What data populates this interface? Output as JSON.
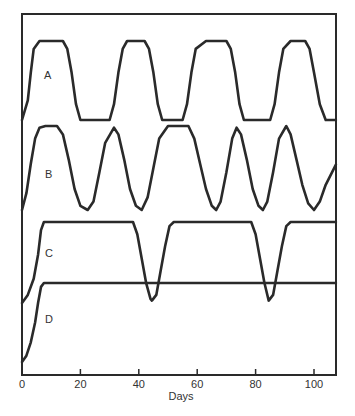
{
  "chart_data": {
    "type": "line",
    "title": "",
    "xlabel": "Days",
    "ylabel": "",
    "xlim": [
      0,
      107.5
    ],
    "xticks": [
      0,
      20,
      40,
      60,
      80,
      100
    ],
    "xtick_labels": [
      "0",
      "20",
      "40",
      "60",
      "80",
      "100"
    ],
    "grid": false,
    "legend": "none (curves labelled inline A, B, C, D)",
    "y_units": "relative level within each stacked band (0 = low, 1 = high)",
    "series": [
      {
        "name": "A",
        "label": "A",
        "band_px": [
          41,
          120
        ],
        "points": [
          [
            0,
            0
          ],
          [
            2,
            0.25
          ],
          [
            3,
            0.6
          ],
          [
            4,
            0.9
          ],
          [
            6,
            1
          ],
          [
            14,
            1
          ],
          [
            15.5,
            0.9
          ],
          [
            17,
            0.6
          ],
          [
            18.5,
            0.2
          ],
          [
            20,
            0
          ],
          [
            30,
            0
          ],
          [
            31.5,
            0.2
          ],
          [
            33,
            0.6
          ],
          [
            34.5,
            0.9
          ],
          [
            36,
            1
          ],
          [
            42,
            1
          ],
          [
            43.5,
            0.9
          ],
          [
            45,
            0.6
          ],
          [
            46.5,
            0.2
          ],
          [
            48,
            0
          ],
          [
            55,
            0
          ],
          [
            56.5,
            0.2
          ],
          [
            58,
            0.6
          ],
          [
            59.5,
            0.9
          ],
          [
            63,
            1
          ],
          [
            70,
            1
          ],
          [
            71.5,
            0.9
          ],
          [
            73,
            0.6
          ],
          [
            74.5,
            0.2
          ],
          [
            76,
            0
          ],
          [
            85,
            0
          ],
          [
            86.5,
            0.2
          ],
          [
            88,
            0.6
          ],
          [
            89.5,
            0.9
          ],
          [
            92,
            1
          ],
          [
            97,
            1
          ],
          [
            98.5,
            0.9
          ],
          [
            100,
            0.6
          ],
          [
            102,
            0.2
          ],
          [
            104,
            0
          ],
          [
            107.5,
            0
          ]
        ]
      },
      {
        "name": "B",
        "label": "B",
        "band_px": [
          126,
          210
        ],
        "points": [
          [
            0,
            0
          ],
          [
            1.5,
            0.2
          ],
          [
            3,
            0.55
          ],
          [
            4.5,
            0.85
          ],
          [
            6,
            0.98
          ],
          [
            8,
            1
          ],
          [
            12,
            1
          ],
          [
            14,
            0.9
          ],
          [
            16,
            0.6
          ],
          [
            18,
            0.25
          ],
          [
            20,
            0.05
          ],
          [
            22.5,
            0
          ],
          [
            24.5,
            0.1
          ],
          [
            26.5,
            0.45
          ],
          [
            28.5,
            0.8
          ],
          [
            31.5,
            0.98
          ],
          [
            33,
            0.9
          ],
          [
            35,
            0.6
          ],
          [
            37,
            0.25
          ],
          [
            39,
            0.05
          ],
          [
            41,
            0
          ],
          [
            43,
            0.15
          ],
          [
            45,
            0.5
          ],
          [
            47,
            0.85
          ],
          [
            50,
            1
          ],
          [
            57,
            1
          ],
          [
            59,
            0.85
          ],
          [
            61,
            0.55
          ],
          [
            63,
            0.25
          ],
          [
            65,
            0.05
          ],
          [
            66.5,
            0
          ],
          [
            68,
            0.1
          ],
          [
            70,
            0.45
          ],
          [
            72,
            0.85
          ],
          [
            73.5,
            0.98
          ],
          [
            75,
            0.9
          ],
          [
            77,
            0.6
          ],
          [
            79,
            0.25
          ],
          [
            81,
            0.05
          ],
          [
            82.5,
            0
          ],
          [
            84,
            0.1
          ],
          [
            86,
            0.45
          ],
          [
            88,
            0.85
          ],
          [
            90.5,
            1
          ],
          [
            92,
            0.9
          ],
          [
            94,
            0.6
          ],
          [
            96,
            0.3
          ],
          [
            98,
            0.08
          ],
          [
            100,
            0
          ],
          [
            102,
            0.1
          ],
          [
            104,
            0.3
          ],
          [
            107.5,
            0.54
          ]
        ]
      },
      {
        "name": "C",
        "label": "C",
        "band_px": [
          222,
          303
        ],
        "points": [
          [
            0,
            0
          ],
          [
            2,
            0.1
          ],
          [
            4,
            0.3
          ],
          [
            5.5,
            0.6
          ],
          [
            6.5,
            0.9
          ],
          [
            7.5,
            1
          ],
          [
            38,
            1
          ],
          [
            39.5,
            0.85
          ],
          [
            41,
            0.55
          ],
          [
            42.5,
            0.25
          ],
          [
            44,
            0.05
          ],
          [
            44.5,
            0.03
          ],
          [
            46,
            0.1
          ],
          [
            47.5,
            0.4
          ],
          [
            49,
            0.7
          ],
          [
            50.5,
            0.95
          ],
          [
            52,
            1
          ],
          [
            78.5,
            1
          ],
          [
            80,
            0.85
          ],
          [
            81.5,
            0.55
          ],
          [
            83,
            0.25
          ],
          [
            84.5,
            0.03
          ],
          [
            86,
            0.1
          ],
          [
            87.5,
            0.4
          ],
          [
            89,
            0.7
          ],
          [
            90.5,
            0.95
          ],
          [
            92,
            1
          ],
          [
            107.5,
            1
          ]
        ]
      },
      {
        "name": "D",
        "label": "D",
        "band_px": [
          283,
          362
        ],
        "points": [
          [
            0,
            0
          ],
          [
            1.5,
            0.08
          ],
          [
            3,
            0.25
          ],
          [
            4.5,
            0.5
          ],
          [
            5.5,
            0.75
          ],
          [
            6.5,
            0.95
          ],
          [
            7.5,
            1
          ],
          [
            107.5,
            1
          ]
        ]
      }
    ]
  },
  "labels": {
    "xlabel": "Days",
    "ticks": [
      "0",
      "20",
      "40",
      "60",
      "80",
      "100"
    ],
    "curves": [
      "A",
      "B",
      "C",
      "D"
    ]
  }
}
